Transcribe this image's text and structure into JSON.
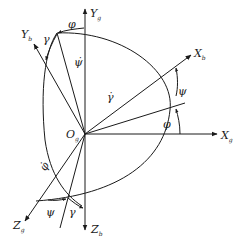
{
  "diagram": {
    "title": "",
    "origin": {
      "label": "O",
      "sub": "g"
    },
    "axes": {
      "Yg": {
        "label": "Y",
        "sub": "g"
      },
      "Xg": {
        "label": "X",
        "sub": "g"
      },
      "Zg": {
        "label": "Z",
        "sub": "g"
      },
      "Yb": {
        "label": "Y",
        "sub": "b"
      },
      "Xb": {
        "label": "X",
        "sub": "b"
      },
      "Zb": {
        "label": "Z",
        "sub": "b"
      }
    },
    "angles": {
      "phi_top": "φ",
      "gamma_top": "γ",
      "psi_dot": "ψ̇",
      "gamma_dot": "γ̇",
      "psi_right": "ψ",
      "phi_right": "φ",
      "phi_dot": "φ̇",
      "psi_bottom": "ψ",
      "gamma_bottom": "γ"
    },
    "line_color": "#1a1a1a"
  }
}
